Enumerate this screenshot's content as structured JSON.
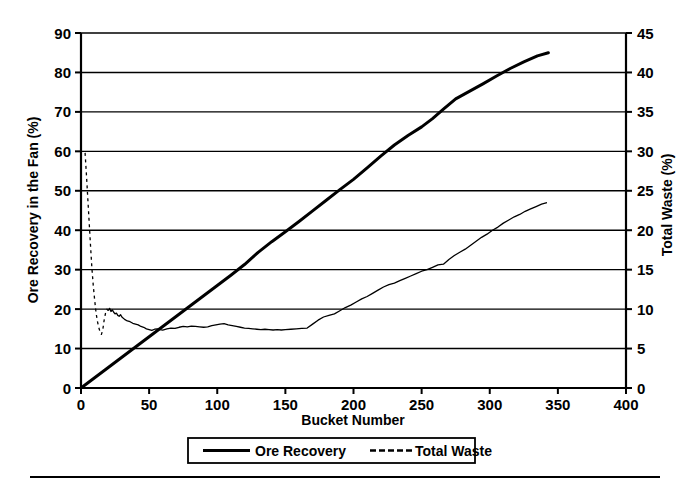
{
  "chart_data": {
    "type": "line",
    "title": "",
    "xlabel": "Bucket Number",
    "ylabel": "Ore Recovery in the Fan (%)",
    "y2label": "Total Waste (%)",
    "xlim": [
      0,
      400
    ],
    "ylim": [
      0,
      90
    ],
    "y2lim": [
      0,
      45
    ],
    "xticks": [
      0,
      50,
      100,
      150,
      200,
      250,
      300,
      350,
      400
    ],
    "yticks": [
      0,
      10,
      20,
      30,
      40,
      50,
      60,
      70,
      80,
      90
    ],
    "y2ticks": [
      0,
      5,
      10,
      15,
      20,
      25,
      30,
      35,
      40,
      45
    ],
    "grid": "horizontal",
    "legend_position": "below-plot",
    "series": [
      {
        "name": "Ore Recovery",
        "axis": "left",
        "style": "solid",
        "linewidth": 3,
        "color": "#000000",
        "x": [
          0,
          10,
          20,
          30,
          40,
          50,
          60,
          70,
          80,
          90,
          100,
          110,
          120,
          130,
          140,
          150,
          160,
          170,
          180,
          190,
          200,
          210,
          220,
          230,
          240,
          250,
          258,
          266,
          275,
          285,
          295,
          305,
          315,
          325,
          335,
          343
        ],
        "y": [
          0,
          2.6,
          5.2,
          7.8,
          10.4,
          13.0,
          15.6,
          18.2,
          20.8,
          23.4,
          26.0,
          28.6,
          31.3,
          34.4,
          37.1,
          39.6,
          42.2,
          44.9,
          47.6,
          50.3,
          52.9,
          55.8,
          58.8,
          61.6,
          64.0,
          66.2,
          68.3,
          70.7,
          73.3,
          75.2,
          77.1,
          79.1,
          81.0,
          82.7,
          84.2,
          85.0
        ]
      },
      {
        "name": "Total Waste",
        "axis": "right",
        "style": "solid-with-dashed-start",
        "linewidth": 1.3,
        "color": "#000000",
        "x": [
          3,
          4,
          5,
          6,
          7,
          8,
          9,
          10,
          11,
          12,
          13,
          14,
          15,
          16,
          17,
          18,
          19,
          20,
          21,
          22,
          23,
          24,
          25,
          26,
          27,
          28,
          29,
          30,
          32,
          34,
          36,
          38,
          40,
          42,
          44,
          46,
          48,
          50,
          52,
          54,
          56,
          58,
          60,
          63,
          66,
          69,
          72,
          75,
          78,
          81,
          84,
          87,
          90,
          93,
          96,
          99,
          102,
          105,
          108,
          111,
          114,
          117,
          120,
          123,
          126,
          129,
          132,
          135,
          138,
          141,
          144,
          147,
          150,
          154,
          158,
          162,
          166,
          170,
          174,
          178,
          182,
          186,
          190,
          194,
          198,
          202,
          206,
          210,
          214,
          218,
          222,
          226,
          230,
          234,
          238,
          242,
          246,
          250,
          254,
          258,
          262,
          266,
          270,
          274,
          278,
          282,
          286,
          290,
          294,
          298,
          302,
          306,
          310,
          314,
          318,
          322,
          326,
          330,
          334,
          338,
          342
        ],
        "y": [
          29.8,
          27.0,
          24.0,
          21.0,
          18.0,
          15.2,
          13.0,
          11.2,
          9.6,
          8.5,
          7.7,
          7.1,
          6.8,
          7.4,
          8.6,
          9.5,
          10.0,
          9.8,
          10.1,
          9.7,
          9.9,
          9.6,
          9.4,
          9.5,
          9.2,
          9.1,
          9.3,
          9.0,
          8.7,
          8.5,
          8.4,
          8.2,
          8.1,
          8.0,
          7.8,
          7.7,
          7.5,
          7.4,
          7.3,
          7.45,
          7.5,
          7.4,
          7.35,
          7.5,
          7.6,
          7.55,
          7.7,
          7.8,
          7.75,
          7.85,
          7.8,
          7.75,
          7.7,
          7.75,
          7.9,
          8.0,
          8.1,
          8.15,
          8.0,
          7.9,
          7.8,
          7.7,
          7.6,
          7.55,
          7.5,
          7.45,
          7.4,
          7.45,
          7.4,
          7.35,
          7.4,
          7.35,
          7.4,
          7.45,
          7.5,
          7.55,
          7.6,
          8.1,
          8.6,
          9.0,
          9.2,
          9.4,
          9.8,
          10.2,
          10.5,
          10.9,
          11.3,
          11.6,
          12.0,
          12.4,
          12.8,
          13.1,
          13.3,
          13.6,
          13.9,
          14.2,
          14.5,
          14.8,
          15.0,
          15.3,
          15.6,
          15.7,
          16.3,
          16.8,
          17.2,
          17.6,
          18.1,
          18.6,
          19.1,
          19.5,
          20.0,
          20.4,
          20.9,
          21.3,
          21.7,
          22.0,
          22.4,
          22.7,
          23.0,
          23.3,
          23.5
        ]
      }
    ]
  },
  "axes": {
    "xlabel": "Bucket Number",
    "ylabel_left": "Ore Recovery in the Fan (%)",
    "ylabel_right": "Total Waste (%)",
    "xticks": [
      "0",
      "50",
      "100",
      "150",
      "200",
      "250",
      "300",
      "350",
      "400"
    ],
    "yticks_left": [
      "0",
      "10",
      "20",
      "30",
      "40",
      "50",
      "60",
      "70",
      "80",
      "90"
    ],
    "yticks_right": [
      "0",
      "5",
      "10",
      "15",
      "20",
      "25",
      "30",
      "35",
      "40",
      "45"
    ]
  },
  "legend": {
    "items": [
      {
        "label": "Ore Recovery",
        "style": "solid"
      },
      {
        "label": "Total Waste",
        "style": "dashed"
      }
    ]
  },
  "colors": {
    "line": "#000000",
    "grid": "#000000",
    "background": "#ffffff"
  }
}
